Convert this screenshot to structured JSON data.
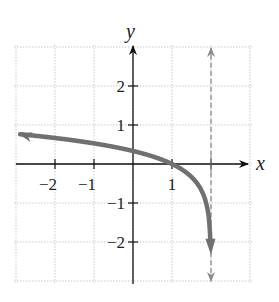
{
  "chart_data": {
    "type": "line",
    "title": "",
    "xlabel": "x",
    "ylabel": "y",
    "xlim": [
      -3,
      3
    ],
    "ylim": [
      -3,
      3
    ],
    "grid": true,
    "grid_style": "dotted",
    "x_ticks": [
      -2,
      -1,
      1
    ],
    "y_ticks": [
      2,
      1,
      -1,
      -2
    ],
    "x_tick_labels": [
      "−2",
      "−1",
      "1"
    ],
    "y_tick_labels": [
      "2",
      "1",
      "−1",
      "−2"
    ],
    "series": [
      {
        "name": "curve",
        "style": "thick solid gray, arrow at both ends",
        "color": "#707070",
        "x": [
          -2.9,
          -2,
          -1,
          0,
          1,
          1.5,
          1.8,
          1.9,
          1.95,
          1.98
        ],
        "y": [
          0.76,
          0.67,
          0.53,
          0.33,
          0.0,
          -0.33,
          -0.77,
          -1.1,
          -1.44,
          -1.88
        ]
      }
    ],
    "annotations": [
      {
        "type": "vertical_asymptote",
        "x": 2,
        "style": "dashed gray with arrows at both ends",
        "color": "#8a8a8a"
      }
    ]
  }
}
